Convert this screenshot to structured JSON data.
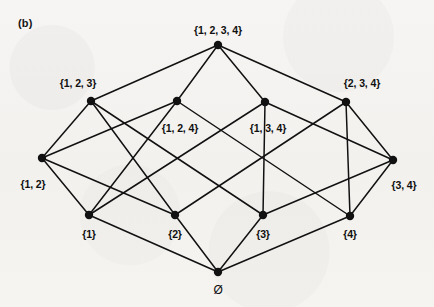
{
  "figure": {
    "panel_label": "(b)",
    "caption": "",
    "background_color": "#f4f3f1",
    "ink_color": "#111111"
  },
  "chart_data": {
    "type": "diagram",
    "diagram_kind": "hasse-diagram",
    "title": "(b)",
    "nodes": [
      {
        "id": "full",
        "label": "{1, 2, 3, 4}",
        "rank": 4,
        "x": 218,
        "y": 45,
        "label_x": 218,
        "label_y": 30,
        "label_anchor": "center"
      },
      {
        "id": "s123",
        "label": "{1, 2, 3}",
        "rank": 3,
        "x": 91,
        "y": 101,
        "label_x": 78,
        "label_y": 83,
        "label_anchor": "center"
      },
      {
        "id": "s124",
        "label": "{1, 2, 4}",
        "rank": 3,
        "x": 177,
        "y": 101,
        "label_x": 180,
        "label_y": 128,
        "label_anchor": "center"
      },
      {
        "id": "s134",
        "label": "{1, 3, 4}",
        "rank": 3,
        "x": 265,
        "y": 102,
        "label_x": 268,
        "label_y": 128,
        "label_anchor": "center"
      },
      {
        "id": "s234",
        "label": "{2, 3, 4}",
        "rank": 3,
        "x": 346,
        "y": 102,
        "label_x": 362,
        "label_y": 83,
        "label_anchor": "center"
      },
      {
        "id": "s12",
        "label": "{1, 2}",
        "rank": 2,
        "x": 42,
        "y": 158,
        "label_x": 33,
        "label_y": 184,
        "label_anchor": "center"
      },
      {
        "id": "s34",
        "label": "{3, 4}",
        "rank": 2,
        "x": 393,
        "y": 160,
        "label_x": 404,
        "label_y": 185,
        "label_anchor": "center"
      },
      {
        "id": "s1",
        "label": "{1}",
        "rank": 1,
        "x": 89,
        "y": 215,
        "label_x": 89,
        "label_y": 234,
        "label_anchor": "center"
      },
      {
        "id": "s2",
        "label": "{2}",
        "rank": 1,
        "x": 175,
        "y": 215,
        "label_x": 175,
        "label_y": 234,
        "label_anchor": "center"
      },
      {
        "id": "s3",
        "label": "{3}",
        "rank": 1,
        "x": 263,
        "y": 215,
        "label_x": 263,
        "label_y": 234,
        "label_anchor": "center"
      },
      {
        "id": "s4",
        "label": "{4}",
        "rank": 1,
        "x": 350,
        "y": 216,
        "label_x": 350,
        "label_y": 234,
        "label_anchor": "center"
      },
      {
        "id": "empty",
        "label": "Ø",
        "rank": 0,
        "x": 218,
        "y": 272,
        "label_x": 218,
        "label_y": 290,
        "label_anchor": "center"
      }
    ],
    "edges": [
      {
        "from": "full",
        "to": "s123"
      },
      {
        "from": "full",
        "to": "s124"
      },
      {
        "from": "full",
        "to": "s134"
      },
      {
        "from": "full",
        "to": "s234"
      },
      {
        "from": "s123",
        "to": "s12"
      },
      {
        "from": "s123",
        "to": "s2"
      },
      {
        "from": "s124",
        "to": "s12"
      },
      {
        "from": "s124",
        "to": "s1"
      },
      {
        "from": "s123",
        "to": "s3"
      },
      {
        "from": "s124",
        "to": "s4"
      },
      {
        "from": "s134",
        "to": "s34"
      },
      {
        "from": "s234",
        "to": "s34"
      },
      {
        "from": "s134",
        "to": "s1"
      },
      {
        "from": "s234",
        "to": "s2"
      },
      {
        "from": "s134",
        "to": "s3"
      },
      {
        "from": "s234",
        "to": "s4"
      },
      {
        "from": "s12",
        "to": "s1"
      },
      {
        "from": "s12",
        "to": "s2"
      },
      {
        "from": "s34",
        "to": "s3"
      },
      {
        "from": "s34",
        "to": "s4"
      },
      {
        "from": "s1",
        "to": "empty"
      },
      {
        "from": "s2",
        "to": "empty"
      },
      {
        "from": "s3",
        "to": "empty"
      },
      {
        "from": "s4",
        "to": "empty"
      }
    ],
    "node_radius": 4.2,
    "edge_width": 1.5,
    "grid": false,
    "legend": null
  }
}
